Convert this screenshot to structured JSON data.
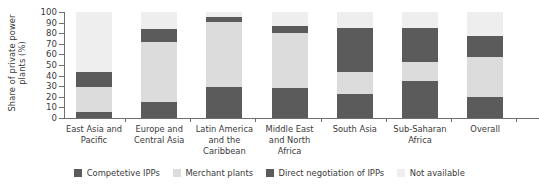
{
  "chart_data": {
    "type": "bar",
    "stacked": true,
    "stacked_mode": "percent",
    "title": "",
    "xlabel": "",
    "ylabel": "Share of private power plants (%)",
    "ylim": [
      0,
      100
    ],
    "ytick_labels": [
      "0",
      "10",
      "20",
      "30",
      "40",
      "50",
      "60",
      "70",
      "80",
      "90",
      "100"
    ],
    "ytick_values": [
      0,
      10,
      20,
      30,
      40,
      50,
      60,
      70,
      80,
      90,
      100
    ],
    "grid": false,
    "legend_position": "bottom",
    "categories": [
      "East Asia and Pacific",
      "Europe and Central Asia",
      "Latin America and the Caribbean",
      "Middle East and North Africa",
      "South Asia",
      "Sub-Saharan Africa",
      "Overall"
    ],
    "category_lines": [
      [
        "East Asia and",
        "Pacific"
      ],
      [
        "Europe and",
        "Central Asia"
      ],
      [
        "Latin America",
        "and the",
        "Caribbean"
      ],
      [
        "Middle East",
        "and North",
        "Africa"
      ],
      [
        "South Asia"
      ],
      [
        "Sub-Saharan",
        "Africa"
      ],
      [
        "Overall"
      ]
    ],
    "series": [
      {
        "name": "Competetive IPPs",
        "color": "#5b5b5b",
        "values": [
          6,
          15,
          29,
          28,
          23,
          35,
          20
        ]
      },
      {
        "name": "Merchant plants",
        "color": "#dcdcdc",
        "values": [
          23,
          57,
          62,
          52,
          20,
          18,
          38
        ]
      },
      {
        "name": "Direct negotiation of IPPs",
        "color": "#5b5b5b",
        "values": [
          14,
          12,
          4,
          7,
          42,
          32,
          19
        ]
      },
      {
        "name": "Not available",
        "color": "#eeeeee",
        "values": [
          57,
          16,
          5,
          13,
          15,
          15,
          23
        ]
      }
    ]
  },
  "legend": {
    "items": [
      {
        "label": "Competetive IPPs",
        "color": "#5b5b5b"
      },
      {
        "label": "Merchant plants",
        "color": "#dcdcdc"
      },
      {
        "label": "Direct negotiation of IPPs",
        "color": "#5b5b5b"
      },
      {
        "label": "Not available",
        "color": "#eeeeee"
      }
    ]
  },
  "axis": {
    "y_title": "Share of private power plants (%)"
  }
}
